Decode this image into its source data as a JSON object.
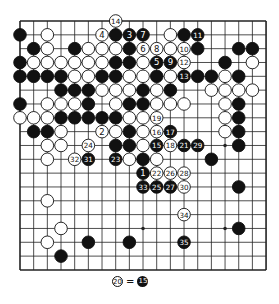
{
  "board": {
    "size": 19,
    "origin_x": 20,
    "origin_y": 21,
    "spacing_x": 13.67,
    "spacing_y": 13.83,
    "star_points": [
      [
        3,
        3
      ],
      [
        3,
        9
      ],
      [
        3,
        15
      ],
      [
        9,
        3
      ],
      [
        9,
        9
      ],
      [
        9,
        15
      ],
      [
        15,
        3
      ],
      [
        15,
        9
      ],
      [
        15,
        15
      ]
    ],
    "colors": {
      "black": "#111111",
      "white": "#ffffff",
      "line": "#222222"
    },
    "stones": [
      {
        "r": 0,
        "c": 7,
        "color": "W",
        "label": "14"
      },
      {
        "r": 1,
        "c": 0,
        "color": "B"
      },
      {
        "r": 1,
        "c": 2,
        "color": "W"
      },
      {
        "r": 1,
        "c": 6,
        "color": "W",
        "label": "4"
      },
      {
        "r": 1,
        "c": 7,
        "color": "B"
      },
      {
        "r": 1,
        "c": 8,
        "color": "B",
        "label": "3"
      },
      {
        "r": 1,
        "c": 9,
        "color": "B",
        "label": "7"
      },
      {
        "r": 1,
        "c": 11,
        "color": "W"
      },
      {
        "r": 1,
        "c": 12,
        "color": "B"
      },
      {
        "r": 1,
        "c": 13,
        "color": "B",
        "label": "11"
      },
      {
        "r": 2,
        "c": 1,
        "color": "B"
      },
      {
        "r": 2,
        "c": 2,
        "color": "W"
      },
      {
        "r": 2,
        "c": 4,
        "color": "B"
      },
      {
        "r": 2,
        "c": 5,
        "color": "W"
      },
      {
        "r": 2,
        "c": 6,
        "color": "W"
      },
      {
        "r": 2,
        "c": 7,
        "color": "W"
      },
      {
        "r": 2,
        "c": 8,
        "color": "B"
      },
      {
        "r": 2,
        "c": 9,
        "color": "W",
        "label": "6"
      },
      {
        "r": 2,
        "c": 10,
        "color": "W",
        "label": "8"
      },
      {
        "r": 2,
        "c": 11,
        "color": "W"
      },
      {
        "r": 2,
        "c": 12,
        "color": "W",
        "label": "10"
      },
      {
        "r": 2,
        "c": 13,
        "color": "B"
      },
      {
        "r": 2,
        "c": 16,
        "color": "B"
      },
      {
        "r": 2,
        "c": 17,
        "color": "B"
      },
      {
        "r": 3,
        "c": 0,
        "color": "B"
      },
      {
        "r": 3,
        "c": 1,
        "color": "W"
      },
      {
        "r": 3,
        "c": 2,
        "color": "W"
      },
      {
        "r": 3,
        "c": 3,
        "color": "W"
      },
      {
        "r": 3,
        "c": 4,
        "color": "W"
      },
      {
        "r": 3,
        "c": 5,
        "color": "W"
      },
      {
        "r": 3,
        "c": 6,
        "color": "W"
      },
      {
        "r": 3,
        "c": 7,
        "color": "B"
      },
      {
        "r": 3,
        "c": 8,
        "color": "B"
      },
      {
        "r": 3,
        "c": 9,
        "color": "W"
      },
      {
        "r": 3,
        "c": 10,
        "color": "B",
        "label": "5"
      },
      {
        "r": 3,
        "c": 11,
        "color": "B",
        "label": "9"
      },
      {
        "r": 3,
        "c": 12,
        "color": "W",
        "label": "12"
      },
      {
        "r": 3,
        "c": 15,
        "color": "B"
      },
      {
        "r": 3,
        "c": 17,
        "color": "W"
      },
      {
        "r": 4,
        "c": 0,
        "color": "B"
      },
      {
        "r": 4,
        "c": 1,
        "color": "B"
      },
      {
        "r": 4,
        "c": 2,
        "color": "B"
      },
      {
        "r": 4,
        "c": 3,
        "color": "B"
      },
      {
        "r": 4,
        "c": 4,
        "color": "W"
      },
      {
        "r": 4,
        "c": 5,
        "color": "W"
      },
      {
        "r": 4,
        "c": 6,
        "color": "B"
      },
      {
        "r": 4,
        "c": 7,
        "color": "B"
      },
      {
        "r": 4,
        "c": 8,
        "color": "W"
      },
      {
        "r": 4,
        "c": 9,
        "color": "W"
      },
      {
        "r": 4,
        "c": 10,
        "color": "B"
      },
      {
        "r": 4,
        "c": 11,
        "color": "W"
      },
      {
        "r": 4,
        "c": 12,
        "color": "B",
        "label": "13"
      },
      {
        "r": 4,
        "c": 13,
        "color": "B"
      },
      {
        "r": 4,
        "c": 14,
        "color": "B"
      },
      {
        "r": 4,
        "c": 15,
        "color": "W"
      },
      {
        "r": 4,
        "c": 16,
        "color": "B"
      },
      {
        "r": 5,
        "c": 3,
        "color": "B"
      },
      {
        "r": 5,
        "c": 4,
        "color": "B"
      },
      {
        "r": 5,
        "c": 5,
        "color": "B"
      },
      {
        "r": 5,
        "c": 6,
        "color": "W"
      },
      {
        "r": 5,
        "c": 7,
        "color": "W"
      },
      {
        "r": 5,
        "c": 8,
        "color": "W"
      },
      {
        "r": 5,
        "c": 9,
        "color": "B"
      },
      {
        "r": 5,
        "c": 10,
        "color": "W"
      },
      {
        "r": 5,
        "c": 11,
        "color": "B"
      },
      {
        "r": 5,
        "c": 14,
        "color": "W"
      },
      {
        "r": 5,
        "c": 15,
        "color": "W"
      },
      {
        "r": 5,
        "c": 16,
        "color": "W"
      },
      {
        "r": 5,
        "c": 17,
        "color": "W"
      },
      {
        "r": 6,
        "c": 0,
        "color": "B"
      },
      {
        "r": 6,
        "c": 2,
        "color": "W"
      },
      {
        "r": 6,
        "c": 3,
        "color": "W"
      },
      {
        "r": 6,
        "c": 4,
        "color": "W"
      },
      {
        "r": 6,
        "c": 5,
        "color": "B"
      },
      {
        "r": 6,
        "c": 7,
        "color": "W"
      },
      {
        "r": 6,
        "c": 8,
        "color": "B"
      },
      {
        "r": 6,
        "c": 9,
        "color": "B"
      },
      {
        "r": 6,
        "c": 10,
        "color": "W"
      },
      {
        "r": 6,
        "c": 11,
        "color": "W"
      },
      {
        "r": 6,
        "c": 12,
        "color": "W"
      },
      {
        "r": 6,
        "c": 15,
        "color": "W"
      },
      {
        "r": 6,
        "c": 16,
        "color": "B"
      },
      {
        "r": 7,
        "c": 0,
        "color": "W"
      },
      {
        "r": 7,
        "c": 1,
        "color": "W"
      },
      {
        "r": 7,
        "c": 2,
        "color": "W"
      },
      {
        "r": 7,
        "c": 3,
        "color": "B"
      },
      {
        "r": 7,
        "c": 4,
        "color": "B"
      },
      {
        "r": 7,
        "c": 5,
        "color": "B"
      },
      {
        "r": 7,
        "c": 6,
        "color": "B"
      },
      {
        "r": 7,
        "c": 7,
        "color": "B"
      },
      {
        "r": 7,
        "c": 8,
        "color": "W"
      },
      {
        "r": 7,
        "c": 9,
        "color": "W"
      },
      {
        "r": 7,
        "c": 10,
        "color": "W",
        "label": "19"
      },
      {
        "r": 7,
        "c": 15,
        "color": "W"
      },
      {
        "r": 7,
        "c": 16,
        "color": "B"
      },
      {
        "r": 8,
        "c": 1,
        "color": "B"
      },
      {
        "r": 8,
        "c": 2,
        "color": "B"
      },
      {
        "r": 8,
        "c": 3,
        "color": "W"
      },
      {
        "r": 8,
        "c": 6,
        "color": "W",
        "label": "2"
      },
      {
        "r": 8,
        "c": 7,
        "color": "W"
      },
      {
        "r": 8,
        "c": 8,
        "color": "B"
      },
      {
        "r": 8,
        "c": 9,
        "color": "W"
      },
      {
        "r": 8,
        "c": 10,
        "color": "W",
        "label": "16"
      },
      {
        "r": 8,
        "c": 11,
        "color": "B",
        "label": "17"
      },
      {
        "r": 8,
        "c": 15,
        "color": "W"
      },
      {
        "r": 8,
        "c": 16,
        "color": "B"
      },
      {
        "r": 9,
        "c": 2,
        "color": "W"
      },
      {
        "r": 9,
        "c": 3,
        "color": "W"
      },
      {
        "r": 9,
        "c": 5,
        "color": "W",
        "label": "24"
      },
      {
        "r": 9,
        "c": 7,
        "color": "B"
      },
      {
        "r": 9,
        "c": 8,
        "color": "B"
      },
      {
        "r": 9,
        "c": 9,
        "color": "W"
      },
      {
        "r": 9,
        "c": 10,
        "color": "B",
        "label": "15"
      },
      {
        "r": 9,
        "c": 11,
        "color": "W",
        "label": "18"
      },
      {
        "r": 9,
        "c": 12,
        "color": "B",
        "label": "21"
      },
      {
        "r": 9,
        "c": 13,
        "color": "B",
        "label": "29"
      },
      {
        "r": 9,
        "c": 16,
        "color": "B"
      },
      {
        "r": 10,
        "c": 2,
        "color": "W"
      },
      {
        "r": 10,
        "c": 4,
        "color": "W",
        "label": "32"
      },
      {
        "r": 10,
        "c": 5,
        "color": "B",
        "label": "31"
      },
      {
        "r": 10,
        "c": 7,
        "color": "B",
        "label": "23"
      },
      {
        "r": 10,
        "c": 8,
        "color": "W"
      },
      {
        "r": 10,
        "c": 9,
        "color": "B"
      },
      {
        "r": 10,
        "c": 10,
        "color": "W"
      },
      {
        "r": 10,
        "c": 14,
        "color": "B"
      },
      {
        "r": 11,
        "c": 9,
        "color": "B",
        "label": "1"
      },
      {
        "r": 11,
        "c": 10,
        "color": "W",
        "label": "22"
      },
      {
        "r": 11,
        "c": 11,
        "color": "W",
        "label": "26"
      },
      {
        "r": 11,
        "c": 12,
        "color": "W",
        "label": "28"
      },
      {
        "r": 12,
        "c": 9,
        "color": "B",
        "label": "33"
      },
      {
        "r": 12,
        "c": 10,
        "color": "B",
        "label": "25"
      },
      {
        "r": 12,
        "c": 11,
        "color": "B",
        "label": "27"
      },
      {
        "r": 12,
        "c": 12,
        "color": "W",
        "label": "30"
      },
      {
        "r": 12,
        "c": 16,
        "color": "B"
      },
      {
        "r": 13,
        "c": 2,
        "color": "W"
      },
      {
        "r": 14,
        "c": 12,
        "color": "W",
        "label": "34"
      },
      {
        "r": 15,
        "c": 3,
        "color": "W"
      },
      {
        "r": 15,
        "c": 16,
        "color": "B"
      },
      {
        "r": 16,
        "c": 2,
        "color": "W"
      },
      {
        "r": 16,
        "c": 5,
        "color": "B"
      },
      {
        "r": 16,
        "c": 8,
        "color": "B"
      },
      {
        "r": 16,
        "c": 12,
        "color": "B",
        "label": "35"
      },
      {
        "r": 17,
        "c": 3,
        "color": "B"
      }
    ]
  },
  "caption": {
    "left_stone_label": "20",
    "left_stone_color": "W",
    "equals": "=",
    "right_stone_label": "15",
    "right_stone_color": "B"
  }
}
